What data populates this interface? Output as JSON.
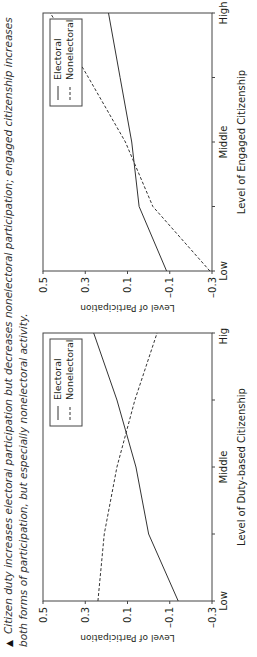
{
  "caption": {
    "marker": "▲",
    "text": "Citizen duty increases electoral participation but decreases nonelectoral participation; engaged citizenship increases both forms of participation, but especially nonelectoral activity."
  },
  "chart_data": [
    {
      "type": "line",
      "title": "",
      "xlabel": "Level of Duty-based Citizenship",
      "ylabel": "Level of Participation",
      "categories": [
        "Low",
        "",
        "Middle",
        "",
        "High"
      ],
      "x_tick_labels": [
        "Low",
        "Middle",
        "High"
      ],
      "yticks": [
        0.5,
        0.3,
        0.1,
        -0.1,
        -0.3
      ],
      "ytick_labels": [
        "0.5",
        "0.3",
        "0.1",
        "–0.1",
        "–0.3"
      ],
      "ylim": [
        -0.3,
        0.5
      ],
      "grid": false,
      "legend_position": "upper right",
      "series": [
        {
          "name": "Electoral",
          "style": "solid",
          "values": [
            -0.14,
            0.0,
            0.06,
            0.15,
            0.26
          ]
        },
        {
          "name": "Nonelectoral",
          "style": "dashed",
          "values": [
            0.24,
            0.21,
            0.15,
            0.065,
            -0.04
          ]
        }
      ]
    },
    {
      "type": "line",
      "title": "",
      "xlabel": "Level of Engaged Citizenship",
      "ylabel": "Level of Participation",
      "categories": [
        "Low",
        "",
        "Middle",
        "",
        "High"
      ],
      "x_tick_labels": [
        "Low",
        "Middle",
        "High"
      ],
      "yticks": [
        0.5,
        0.3,
        0.1,
        -0.1,
        -0.3
      ],
      "ytick_labels": [
        "0.5",
        "0.3",
        "0.1",
        "–0.1",
        "–0.3"
      ],
      "ylim": [
        -0.3,
        0.5
      ],
      "grid": false,
      "legend_position": "upper right",
      "series": [
        {
          "name": "Electoral",
          "style": "solid",
          "values": [
            -0.085,
            0.045,
            0.08,
            0.135,
            0.19
          ]
        },
        {
          "name": "Nonelectoral",
          "style": "dashed",
          "values": [
            -0.29,
            -0.02,
            0.11,
            0.285,
            0.465
          ]
        }
      ]
    }
  ]
}
